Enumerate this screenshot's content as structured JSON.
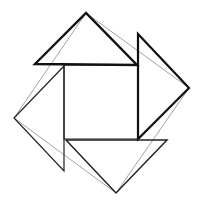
{
  "diagram": {
    "colors": {
      "background": "#ffffff",
      "thick_stroke": "#111111",
      "thin_stroke": "#888888"
    },
    "inner_square": {
      "points": "64,65 138,65 138,139 64,139"
    },
    "triangles": [
      {
        "name": "top",
        "points": "35,64 86,13 137,65"
      },
      {
        "name": "right",
        "points": "138,34 189,88 138,139"
      },
      {
        "name": "bottom",
        "points": "66,140 167,140 116,193"
      },
      {
        "name": "left",
        "points": "64,66 14,118 64,171"
      }
    ],
    "outer_square": {
      "points": "86,13 189,88 116,193 14,118"
    }
  }
}
